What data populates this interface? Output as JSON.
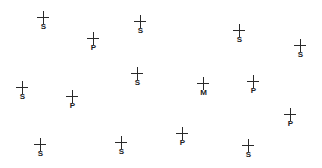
{
  "diagram": {
    "background": "#ffffff",
    "marker_color": "#2a2a2a",
    "legend_types": [
      "S",
      "P",
      "M"
    ],
    "markers": [
      {
        "label": "S",
        "x": 43,
        "y": 18
      },
      {
        "label": "P",
        "x": 93,
        "y": 39
      },
      {
        "label": "S",
        "x": 140,
        "y": 22
      },
      {
        "label": "S",
        "x": 239,
        "y": 31
      },
      {
        "label": "S",
        "x": 300,
        "y": 46
      },
      {
        "label": "S",
        "x": 22,
        "y": 88
      },
      {
        "label": "P",
        "x": 72,
        "y": 97
      },
      {
        "label": "S",
        "x": 137,
        "y": 74
      },
      {
        "label": "M",
        "x": 203,
        "y": 84
      },
      {
        "label": "P",
        "x": 253,
        "y": 82
      },
      {
        "label": "P",
        "x": 290,
        "y": 115
      },
      {
        "label": "S",
        "x": 40,
        "y": 145
      },
      {
        "label": "S",
        "x": 121,
        "y": 143
      },
      {
        "label": "P",
        "x": 182,
        "y": 134
      },
      {
        "label": "S",
        "x": 248,
        "y": 146
      }
    ]
  }
}
